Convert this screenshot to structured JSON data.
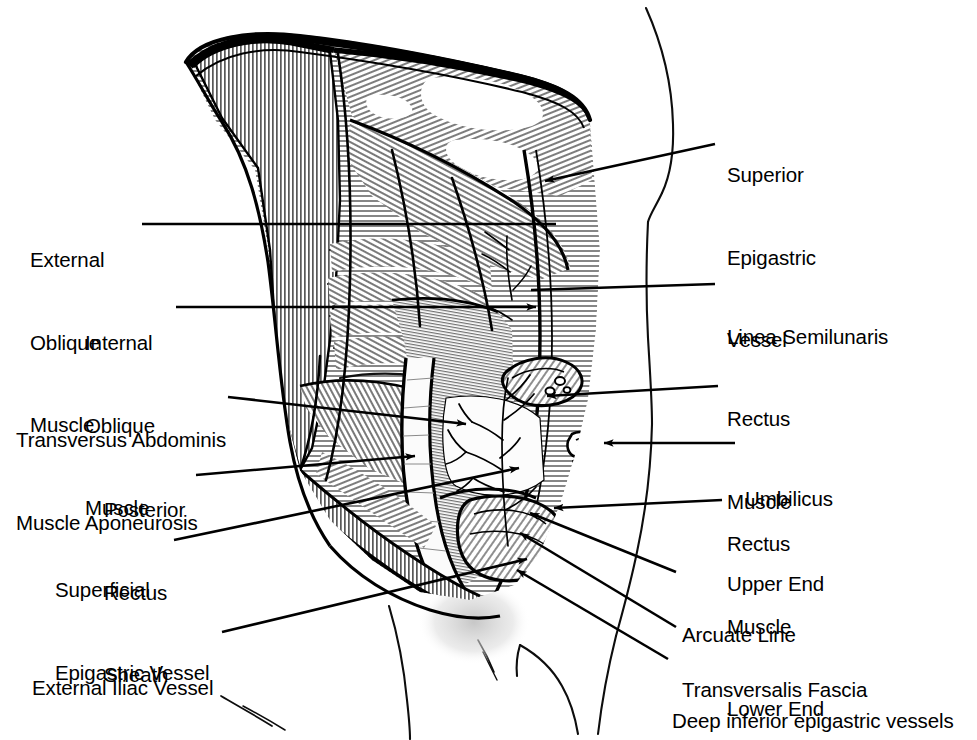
{
  "figure": {
    "style": "black-and-white line engraving with cross-hatching",
    "background_color": "#ffffff",
    "ink_color": "#000000",
    "width": 977,
    "height": 740
  },
  "labels": [
    {
      "id": "external-oblique-muscle",
      "side": "left",
      "lines": [
        "External",
        "Oblique",
        "Muscle"
      ],
      "text": "External Oblique Muscle",
      "text_x": 30,
      "text_y": 191,
      "align": "left",
      "leader": {
        "type": "line",
        "x1": 142,
        "y1": 224,
        "x2": 556,
        "y2": 224,
        "arrow": false
      }
    },
    {
      "id": "internal-oblique-muscle",
      "side": "left",
      "lines": [
        "Internal",
        "Oblique",
        "Muscle"
      ],
      "text": "Internal Oblique Muscle",
      "text_x": 85,
      "text_y": 274,
      "align": "left",
      "leader": {
        "type": "line",
        "x1": 176,
        "y1": 307,
        "x2": 536,
        "y2": 307,
        "arrow": true
      }
    },
    {
      "id": "transversus-abdominis-muscle-aponeurosis",
      "side": "left",
      "lines": [
        "Transversus Abdominis",
        "Muscle Aponeurosis"
      ],
      "text": "Transversus Abdominis Muscle Aponeurosis",
      "text_x": 16,
      "text_y": 371,
      "align": "left",
      "leader": {
        "type": "line",
        "x1": 228,
        "y1": 397,
        "x2": 466,
        "y2": 424,
        "arrow": true
      }
    },
    {
      "id": "posterior-rectus-sheath",
      "side": "left",
      "lines": [
        "Posterior",
        "Rectus",
        "Sheath"
      ],
      "text": "Posterior Rectus Sheath",
      "text_x": 104,
      "text_y": 441,
      "align": "left",
      "leader": {
        "type": "line",
        "x1": 196,
        "y1": 475,
        "x2": 415,
        "y2": 456,
        "arrow": true
      }
    },
    {
      "id": "superficial-epigastric-vessel",
      "side": "left",
      "lines": [
        "Superficial",
        "Epigastric Vessel"
      ],
      "text": "Superficial Epigastric Vessel",
      "text_x": 55,
      "text_y": 521,
      "align": "left",
      "leader": {
        "type": "line",
        "x1": 174,
        "y1": 540,
        "x2": 519,
        "y2": 468,
        "arrow": true
      }
    },
    {
      "id": "external-iliac-vessel",
      "side": "left",
      "lines": [
        "External Iliac Vessel"
      ],
      "text": "External Iliac Vessel",
      "text_x": 32,
      "text_y": 619,
      "align": "left",
      "leader": {
        "type": "line",
        "x1": 222,
        "y1": 632,
        "x2": 527,
        "y2": 559,
        "arrow": true
      }
    },
    {
      "id": "superior-epigastric-vessel",
      "side": "right",
      "lines": [
        "Superior",
        "Epigastric",
        "Vessel"
      ],
      "text": "Superior Epigastric Vessel",
      "text_x": 727,
      "text_y": 106,
      "align": "left",
      "leader": {
        "type": "line",
        "x1": 715,
        "y1": 144,
        "x2": 545,
        "y2": 181,
        "arrow": true
      }
    },
    {
      "id": "linea-semilunaris",
      "side": "right",
      "lines": [
        "Linea Semilunaris"
      ],
      "text": "Linea Semilunaris",
      "text_x": 727,
      "text_y": 268,
      "align": "left",
      "leader": {
        "type": "line",
        "x1": 715,
        "y1": 284,
        "x2": 531,
        "y2": 290,
        "arrow": false
      }
    },
    {
      "id": "rectus-muscle-upper-end",
      "side": "right",
      "lines": [
        "Rectus",
        "Muscle",
        "Upper End"
      ],
      "text": "Rectus Muscle Upper End",
      "text_x": 727,
      "text_y": 350,
      "align": "left",
      "leader": {
        "type": "line",
        "x1": 718,
        "y1": 386,
        "x2": 547,
        "y2": 396,
        "arrow": true
      }
    },
    {
      "id": "umbilicus",
      "side": "right",
      "lines": [
        "Umbilicus"
      ],
      "text": "Umbilicus",
      "text_x": 745,
      "text_y": 430,
      "align": "left",
      "leader": {
        "type": "line",
        "x1": 735,
        "y1": 443,
        "x2": 604,
        "y2": 443,
        "arrow": true
      }
    },
    {
      "id": "rectus-muscle-lower-end",
      "side": "right",
      "lines": [
        "Rectus",
        "Muscle",
        "Lower End"
      ],
      "text": "Rectus Muscle Lower End",
      "text_x": 727,
      "text_y": 475,
      "align": "left",
      "leader": {
        "type": "line",
        "x1": 722,
        "y1": 500,
        "x2": 554,
        "y2": 508,
        "arrow": true
      }
    },
    {
      "id": "arcuate-line",
      "side": "right",
      "lines": [
        "Arcuate Line"
      ],
      "text": "Arcuate Line",
      "text_x": 682,
      "text_y": 566,
      "align": "left",
      "leader": {
        "type": "line",
        "x1": 676,
        "y1": 572,
        "x2": 530,
        "y2": 513,
        "arrow": true
      }
    },
    {
      "id": "transversalis-fascia",
      "side": "right",
      "lines": [
        "Transversalis Fascia"
      ],
      "text": "Transversalis Fascia",
      "text_x": 682,
      "text_y": 621,
      "align": "left",
      "leader": {
        "type": "line",
        "x1": 676,
        "y1": 627,
        "x2": 520,
        "y2": 533,
        "arrow": true
      }
    },
    {
      "id": "deep-inferior-epigastric-vessels",
      "side": "right",
      "lines": [
        "Deep inferior epigastric vessels"
      ],
      "text": "Deep inferior epigastric vessels",
      "text_x": 672,
      "text_y": 652,
      "align": "left",
      "leader": {
        "type": "line",
        "x1": 668,
        "y1": 659,
        "x2": 517,
        "y2": 570,
        "arrow": true
      }
    }
  ]
}
